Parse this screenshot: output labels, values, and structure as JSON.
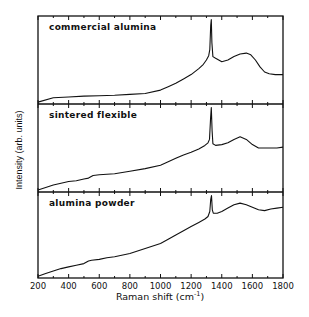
{
  "chart_data": {
    "type": "line",
    "title": "",
    "xlabel": "Raman shift (cm",
    "xlabel_sup": "-1",
    "xlabel_close": ")",
    "ylabel": "Intensity (arb. units)",
    "xlim": [
      200,
      1800
    ],
    "x_ticks": [
      200,
      400,
      600,
      800,
      1000,
      1200,
      1400,
      1600,
      1800
    ],
    "x_minor_step": 100,
    "grid": false,
    "legend": "none (panel labels inside each stacked panel)",
    "layout": "three vertically stacked panels sharing the x axis",
    "panels": [
      {
        "name": "commercial alumina",
        "x": [
          200,
          300,
          400,
          500,
          600,
          700,
          800,
          900,
          1000,
          1050,
          1100,
          1150,
          1200,
          1250,
          1280,
          1300,
          1315,
          1322,
          1328,
          1332,
          1336,
          1342,
          1360,
          1400,
          1440,
          1480,
          1520,
          1560,
          1590,
          1620,
          1650,
          1680,
          1710,
          1750,
          1800
        ],
        "y": [
          0.01,
          0.06,
          0.07,
          0.08,
          0.085,
          0.09,
          0.1,
          0.11,
          0.15,
          0.19,
          0.23,
          0.28,
          0.33,
          0.4,
          0.45,
          0.5,
          0.55,
          0.62,
          0.9,
          0.97,
          0.7,
          0.54,
          0.52,
          0.48,
          0.5,
          0.54,
          0.57,
          0.58,
          0.56,
          0.5,
          0.42,
          0.36,
          0.34,
          0.33,
          0.33
        ]
      },
      {
        "name": "sintered flexible",
        "x": [
          200,
          250,
          300,
          350,
          400,
          450,
          500,
          530,
          560,
          600,
          700,
          800,
          900,
          1000,
          1050,
          1100,
          1150,
          1200,
          1250,
          1290,
          1310,
          1320,
          1327,
          1332,
          1337,
          1342,
          1360,
          1400,
          1440,
          1480,
          1520,
          1560,
          1600,
          1640,
          1680,
          1720,
          1760,
          1800
        ],
        "y": [
          0.01,
          0.04,
          0.07,
          0.09,
          0.11,
          0.12,
          0.14,
          0.15,
          0.18,
          0.19,
          0.2,
          0.23,
          0.26,
          0.3,
          0.34,
          0.38,
          0.42,
          0.45,
          0.49,
          0.53,
          0.56,
          0.6,
          0.85,
          0.97,
          0.7,
          0.55,
          0.53,
          0.54,
          0.56,
          0.6,
          0.63,
          0.6,
          0.54,
          0.5,
          0.5,
          0.5,
          0.5,
          0.51
        ]
      },
      {
        "name": "alumina powder",
        "x": [
          200,
          250,
          300,
          350,
          400,
          450,
          500,
          530,
          550,
          600,
          650,
          700,
          800,
          900,
          1000,
          1050,
          1100,
          1150,
          1200,
          1250,
          1290,
          1310,
          1322,
          1328,
          1333,
          1338,
          1345,
          1370,
          1400,
          1440,
          1480,
          1520,
          1560,
          1600,
          1640,
          1680,
          1720,
          1760,
          1800
        ],
        "y": [
          0.01,
          0.04,
          0.07,
          0.1,
          0.12,
          0.14,
          0.16,
          0.19,
          0.2,
          0.21,
          0.23,
          0.24,
          0.28,
          0.34,
          0.4,
          0.45,
          0.5,
          0.55,
          0.6,
          0.65,
          0.69,
          0.72,
          0.78,
          0.92,
          0.97,
          0.8,
          0.76,
          0.76,
          0.78,
          0.82,
          0.86,
          0.88,
          0.86,
          0.83,
          0.8,
          0.79,
          0.81,
          0.82,
          0.83
        ]
      }
    ]
  }
}
